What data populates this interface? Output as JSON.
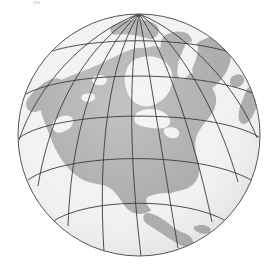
{
  "figure": {
    "background_color": "#ffffff",
    "artifact_label": "scan-speck"
  },
  "globe": {
    "projection": "orthographic",
    "center_x": 139,
    "center_y": 135,
    "radius": 121,
    "center_longitude": -95,
    "center_latitude": 38,
    "ocean_color": "#f1f1f1",
    "ocean_shadow_color": "#e2e2e2",
    "land_color": "#a9a9a9",
    "land_shade_color": "#9d9d9d",
    "graticule_color": "#3b3b3b",
    "graticule_width": 0.9,
    "outline_color": "#555555",
    "outline_width": 1.0,
    "graticule_spacing_degrees": 20,
    "meridian_longitudes": [
      -175,
      -155,
      -135,
      -115,
      -95,
      -75,
      -55,
      -35,
      -15
    ],
    "parallel_latitudes": [
      80,
      60,
      40,
      20,
      0,
      -20
    ],
    "labels": {
      "north_pole": "North Pole",
      "equator": "Equator"
    }
  },
  "landmasses": [
    {
      "name": "north-america-mainland"
    },
    {
      "name": "greenland"
    },
    {
      "name": "canadian-arctic-islands"
    },
    {
      "name": "great-lakes"
    },
    {
      "name": "hudson-bay"
    },
    {
      "name": "baffin-island"
    },
    {
      "name": "alaska"
    },
    {
      "name": "central-america"
    },
    {
      "name": "caribbean-islands"
    },
    {
      "name": "south-america-north"
    },
    {
      "name": "iceland"
    },
    {
      "name": "western-europe-edge"
    },
    {
      "name": "northeast-asia-edge"
    }
  ]
}
